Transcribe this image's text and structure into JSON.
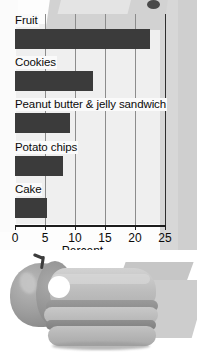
{
  "chart_data": {
    "type": "bar",
    "orientation": "horizontal",
    "title": "",
    "categories": [
      "Fruit",
      "Cookies",
      "Peanut butter & jelly sandwich",
      "Potato chips",
      "Cake"
    ],
    "values": [
      22.5,
      13,
      9.2,
      8,
      5.3
    ],
    "xlabel": "Percent",
    "ylabel": "",
    "xlim": [
      0,
      25
    ],
    "xticks": [
      0,
      5,
      10,
      15,
      20,
      25
    ],
    "xtick_labels": [
      "0",
      "5",
      "10",
      "15",
      "20",
      "25"
    ],
    "grid": "vertical",
    "legend": "none",
    "bar_color": "#3b3b3b",
    "axis_color": "#1d1d1d",
    "gridline_color": "#8c8c8c"
  },
  "chart": {
    "axis_title": "Percent",
    "bars": [
      {
        "label": "Fruit",
        "value": 22.5
      },
      {
        "label": "Cookies",
        "value": 13
      },
      {
        "label": "Peanut butter & jelly sandwich",
        "value": 9.2
      },
      {
        "label": "Potato chips",
        "value": 8
      },
      {
        "label": "Cake",
        "value": 5.3
      }
    ],
    "ticks": [
      {
        "label": "0",
        "value": 0
      },
      {
        "label": "5",
        "value": 5
      },
      {
        "label": "10",
        "value": 10
      },
      {
        "label": "15",
        "value": 15
      },
      {
        "label": "20",
        "value": 20
      },
      {
        "label": "25",
        "value": 25
      }
    ]
  },
  "illustration": {
    "name": "apple-and-sandwich-photo",
    "items": [
      "apple",
      "peanut-butter-jelly-sandwich"
    ]
  },
  "colors": {
    "bar": "#3b3b3b",
    "axis": "#1d1d1d",
    "grid": "#8c8c8c",
    "text": "#0a0a0a",
    "background": "#fdfdfd"
  }
}
